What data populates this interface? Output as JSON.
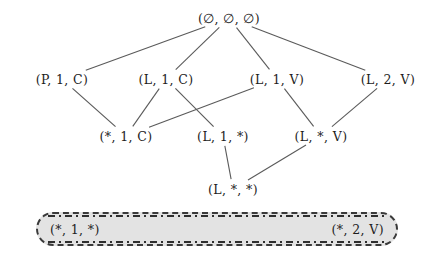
{
  "diagram": {
    "type": "hasse-lattice",
    "nodes": [
      {
        "id": "n0",
        "label": "(∅, ∅, ∅)",
        "x": 229,
        "y": 18,
        "row": 0
      },
      {
        "id": "n1",
        "label": "(P, 1, C)",
        "x": 62,
        "y": 79,
        "row": 1
      },
      {
        "id": "n2",
        "label": "(L, 1, C)",
        "x": 166,
        "y": 79,
        "row": 1
      },
      {
        "id": "n3",
        "label": "(L, 1, V)",
        "x": 277,
        "y": 79,
        "row": 1
      },
      {
        "id": "n4",
        "label": "(L, 2, V)",
        "x": 388,
        "y": 79,
        "row": 1
      },
      {
        "id": "n5",
        "label": "(*, 1, C)",
        "x": 126,
        "y": 136,
        "row": 2
      },
      {
        "id": "n6",
        "label": "(L, 1, *)",
        "x": 223,
        "y": 136,
        "row": 2
      },
      {
        "id": "n7",
        "label": "(L, *, V)",
        "x": 321,
        "y": 136,
        "row": 2
      },
      {
        "id": "n8",
        "label": "(L, *, *)",
        "x": 233,
        "y": 189,
        "row": 3
      }
    ],
    "edges": [
      {
        "from": "n0",
        "to": "n1"
      },
      {
        "from": "n0",
        "to": "n2"
      },
      {
        "from": "n0",
        "to": "n3"
      },
      {
        "from": "n0",
        "to": "n4"
      },
      {
        "from": "n1",
        "to": "n5"
      },
      {
        "from": "n2",
        "to": "n5"
      },
      {
        "from": "n2",
        "to": "n6"
      },
      {
        "from": "n3",
        "to": "n5"
      },
      {
        "from": "n3",
        "to": "n7"
      },
      {
        "from": "n4",
        "to": "n7"
      },
      {
        "from": "n6",
        "to": "n8"
      },
      {
        "from": "n7",
        "to": "n8"
      }
    ],
    "highlight_box": {
      "left_label": "(*, 1, *)",
      "right_label": "(*, 2, V)",
      "fill_color": "#e3e3e3",
      "border_color": "#2e2e2e",
      "border_style": "dash-dot rounded"
    },
    "colors": {
      "background": "#ffffff",
      "text": "#1d1d1d",
      "edge": "#5a5a5a"
    }
  }
}
